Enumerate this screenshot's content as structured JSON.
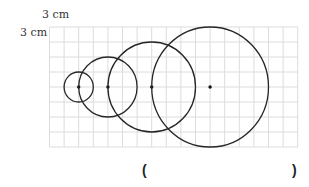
{
  "labels": {
    "scale_horizontal": "3 cm",
    "scale_vertical": "3 cm"
  },
  "answer": {
    "open_paren": "(",
    "close_paren": ")",
    "value": ""
  },
  "grid": {
    "columns": 17,
    "rows": 8,
    "x0": 49.5,
    "y0": 27,
    "cell_w": 14.6,
    "cell_h": 15,
    "line_color": "#dcdcdc"
  },
  "circles": [
    {
      "center_col": 2,
      "center_row": 4,
      "radius_units": 1
    },
    {
      "center_col": 4,
      "center_row": 4,
      "radius_units": 2
    },
    {
      "center_col": 7,
      "center_row": 4,
      "radius_units": 3
    },
    {
      "center_col": 11,
      "center_row": 4,
      "radius_units": 4
    }
  ],
  "colors": {
    "stroke": "#262626",
    "center_dot": "#111111"
  }
}
